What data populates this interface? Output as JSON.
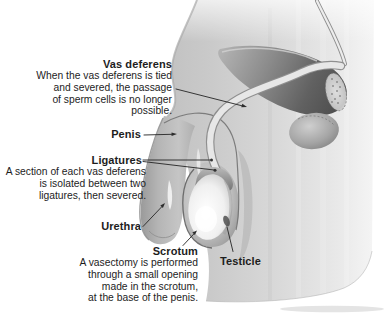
{
  "colors": {
    "page-bg": "#ffffff",
    "ink": "#1d1d1d",
    "leader": "#2d2d2d"
  },
  "annotations": {
    "vas_deferens": {
      "heading": "Vas deferens",
      "lines": [
        "When the vas deferens is tied",
        "and severed, the passage",
        "of sperm cells is no longer",
        "possible."
      ]
    },
    "penis": {
      "heading": "Penis"
    },
    "ligatures": {
      "heading": "Ligatures",
      "lines": [
        "A section of each vas deferens",
        "is isolated between two",
        "ligatures, then severed."
      ]
    },
    "urethra": {
      "heading": "Urethra"
    },
    "scrotum": {
      "heading": "Scrotum",
      "lines": [
        "A vasectomy is performed",
        "through a small opening",
        "made in the scrotum,",
        "at the base of the penis."
      ]
    },
    "testicle": {
      "heading": "Testicle"
    }
  }
}
